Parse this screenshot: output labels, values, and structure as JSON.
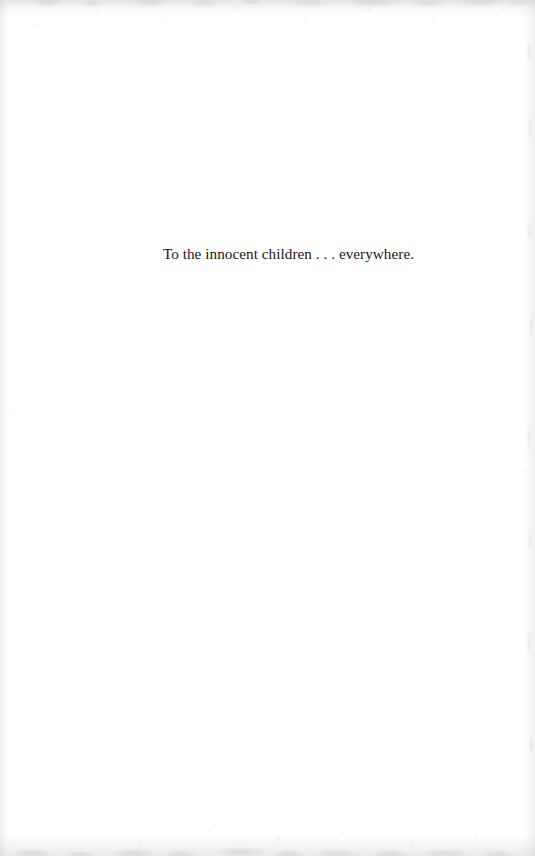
{
  "page": {
    "kind": "book-dedication-page",
    "background_color": "#ffffff",
    "text_color": "#191919",
    "width": 535,
    "height": 856
  },
  "dedication": {
    "text": "To the innocent children . . . everywhere.",
    "alignment": "center"
  },
  "artifacts": {
    "top_edge_label": "scan-edge-smudge-top",
    "bottom_edge_label": "scan-edge-smudge-bottom",
    "left_edge_label": "scan-edge-grain-left",
    "right_edge_label": "scan-edge-grain-right",
    "speckle_label": "scan-speckle-texture"
  }
}
